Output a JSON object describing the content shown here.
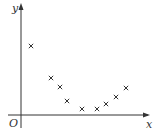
{
  "chart_data": {
    "type": "scatter",
    "title": "",
    "xlabel": "x",
    "ylabel": "y",
    "origin_label": "O",
    "marker": "x",
    "grid": false,
    "legend": null,
    "points_px": [
      [
        31,
        46
      ],
      [
        51,
        78
      ],
      [
        60,
        87
      ],
      [
        67,
        101
      ],
      [
        82,
        109
      ],
      [
        97,
        109
      ],
      [
        106,
        104
      ],
      [
        116,
        97
      ],
      [
        126,
        88
      ]
    ],
    "x": [
      1,
      3,
      4,
      5,
      6.5,
      8,
      9,
      10,
      11
    ],
    "y": [
      7,
      4,
      3.2,
      1.4,
      0.6,
      0.6,
      1.1,
      1.8,
      2.8
    ]
  },
  "labels": {
    "x": "x",
    "y": "y",
    "origin": "O"
  }
}
